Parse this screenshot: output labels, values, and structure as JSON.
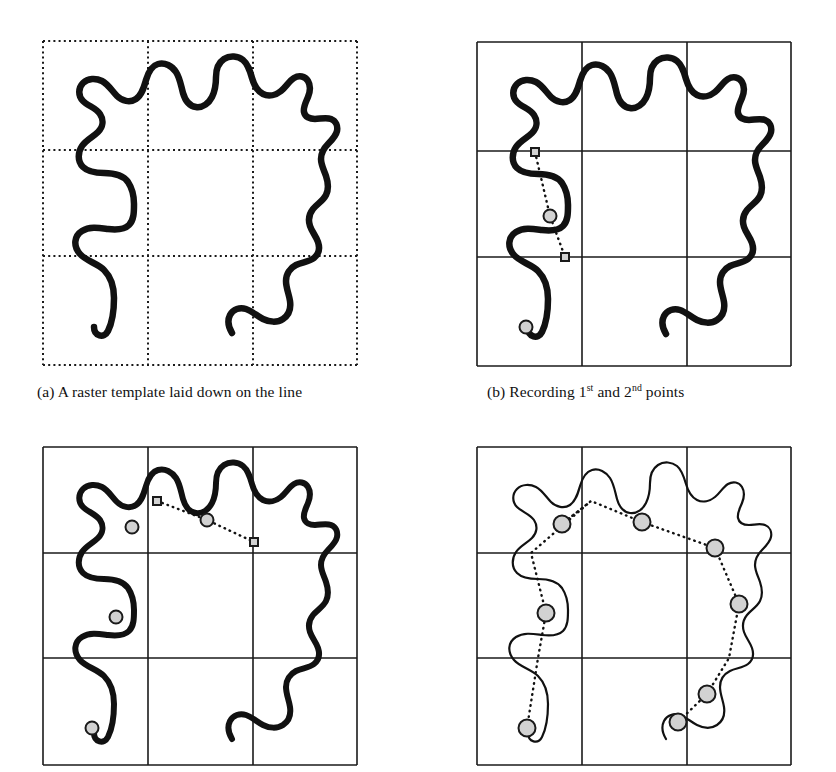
{
  "figure": {
    "kind": "raster-template-line-generalisation",
    "background": "#ffffff",
    "ink": "#111111",
    "grid_color": "#1a1a1a",
    "marker_fill": "#d2d2d2",
    "marker_stroke": "#1a1a1a",
    "dotted_connector_color": "#111111"
  },
  "captions": {
    "a_prefix": "(a)",
    "a_text": "A raster template laid down on the line",
    "b_prefix": "(b)",
    "b_text_before": "Recording 1",
    "b_sup1": "st",
    "b_text_middle": " and 2",
    "b_sup2": "nd",
    "b_text_after": " points",
    "c_text": "",
    "d_text": ""
  },
  "panels": [
    {
      "id": "a",
      "name": "panel-a-raster-template",
      "size": [
        316,
        326
      ],
      "grid": {
        "style": "dotted",
        "rows": 3,
        "cols": 3,
        "x_lines": [
          1,
          106,
          211,
          315
        ],
        "y_lines": [
          1,
          110,
          216,
          325
        ]
      },
      "line_width": 6.5,
      "line_style": "thick",
      "markers": [],
      "connectors": []
    },
    {
      "id": "b",
      "name": "panel-b-first-second-points",
      "size": [
        316,
        326
      ],
      "grid": {
        "style": "solid",
        "rows": 3,
        "cols": 3,
        "x_lines": [
          1,
          106,
          211,
          315
        ],
        "y_lines": [
          1,
          110,
          216,
          325
        ]
      },
      "line_width": 6.5,
      "line_style": "thick",
      "markers": [
        {
          "type": "circle",
          "name": "point-start",
          "x": 50,
          "y": 286,
          "r": 6.5
        },
        {
          "type": "circle",
          "name": "point-1st",
          "x": 74,
          "y": 175,
          "r": 6.5
        },
        {
          "type": "square",
          "name": "crossing-upper",
          "x": 59,
          "y": 111,
          "s": 8
        },
        {
          "type": "square",
          "name": "crossing-lower",
          "x": 89,
          "y": 216,
          "s": 8
        }
      ],
      "connectors": [
        {
          "name": "connector-b",
          "points": [
            [
              59,
              111
            ],
            [
              74,
              175
            ],
            [
              89,
              216
            ]
          ]
        }
      ]
    },
    {
      "id": "c",
      "name": "panel-c-third-fourth-points",
      "size": [
        316,
        320
      ],
      "grid": {
        "style": "solid",
        "rows": 3,
        "cols": 3,
        "x_lines": [
          1,
          106,
          211,
          315
        ],
        "y_lines": [
          1,
          107,
          212,
          319
        ]
      },
      "line_width": 6.0,
      "line_style": "thick",
      "markers": [
        {
          "type": "circle",
          "name": "point-start",
          "x": 50,
          "y": 282,
          "r": 6.5
        },
        {
          "type": "circle",
          "name": "point-1st",
          "x": 74,
          "y": 171,
          "r": 6.5
        },
        {
          "type": "circle",
          "name": "point-2nd",
          "x": 90,
          "y": 81,
          "r": 6.5
        },
        {
          "type": "square",
          "name": "crossing-top",
          "x": 115,
          "y": 55,
          "s": 8
        },
        {
          "type": "circle",
          "name": "point-3rd",
          "x": 165,
          "y": 74,
          "r": 6.5
        },
        {
          "type": "square",
          "name": "crossing-right",
          "x": 212,
          "y": 96,
          "s": 8
        }
      ],
      "connectors": [
        {
          "name": "connector-c",
          "points": [
            [
              115,
              55
            ],
            [
              165,
              74
            ],
            [
              212,
              96
            ]
          ]
        }
      ]
    },
    {
      "id": "d",
      "name": "panel-d-completed-generalisation",
      "size": [
        316,
        320
      ],
      "grid": {
        "style": "solid",
        "rows": 3,
        "cols": 3,
        "x_lines": [
          1,
          106,
          211,
          315
        ],
        "y_lines": [
          1,
          107,
          212,
          319
        ]
      },
      "line_width": 2.2,
      "line_style": "thin",
      "markers": [
        {
          "type": "circle",
          "name": "point-1",
          "x": 51,
          "y": 282,
          "r": 8.5
        },
        {
          "type": "circle",
          "name": "point-2",
          "x": 70,
          "y": 167,
          "r": 8.5
        },
        {
          "type": "circle",
          "name": "point-3",
          "x": 86,
          "y": 78,
          "r": 8.5
        },
        {
          "type": "circle",
          "name": "point-4",
          "x": 166,
          "y": 76,
          "r": 8.5
        },
        {
          "type": "circle",
          "name": "point-5",
          "x": 239,
          "y": 102,
          "r": 8.5
        },
        {
          "type": "circle",
          "name": "point-6",
          "x": 263,
          "y": 158,
          "r": 8.5
        },
        {
          "type": "circle",
          "name": "point-7",
          "x": 231,
          "y": 248,
          "r": 8.5
        },
        {
          "type": "circle",
          "name": "point-8",
          "x": 202,
          "y": 276,
          "r": 8.5
        }
      ],
      "connectors": [
        {
          "name": "connector-d",
          "points": [
            [
              51,
              282
            ],
            [
              62,
              212
            ],
            [
              70,
              167
            ],
            [
              55,
              107
            ],
            [
              115,
              55
            ],
            [
              86,
              78
            ],
            [
              115,
              55
            ],
            [
              166,
              76
            ],
            [
              239,
              102
            ],
            [
              263,
              158
            ],
            [
              253,
              212
            ],
            [
              231,
              248
            ],
            [
              202,
              276
            ]
          ]
        }
      ]
    }
  ],
  "curve": {
    "name": "meandering-line",
    "path": "M 52,287 C 52,296 62,299 66,291 C 70,283 72,270 72,258 C 72,246 68,236 62,230 C 55,223 44,221 38,214 C 31,206 32,196 40,191 C 48,186 58,188 66,189 C 74,190 82,190 87,185 C 92,180 92,172 92,164 C 92,156 90,148 86,142 C 81,135 70,133 62,133 C 54,133 46,132 41,127 C 35,121 36,112 40,106 C 44,100 51,97 56,92 C 61,87 62,80 58,74 C 54,68 46,66 41,61 C 36,56 36,48 41,43 C 46,38 54,38 60,41 C 66,44 70,51 75,56 C 80,61 88,63 94,59 C 100,55 102,47 104,40 C 106,33 109,26 116,24 C 123,22 130,26 134,32 C 138,38 139,46 141,53 C 143,60 147,66 154,67 C 161,68 167,63 170,57 C 173,51 174,44 174,37 C 174,30 176,23 182,19 C 188,15 196,16 201,20 C 206,24 208,31 210,38 C 212,45 215,51 221,54 C 227,57 234,55 239,51 C 244,47 247,41 252,38 C 257,35 263,36 266,41 C 269,46 268,52 266,57 C 264,62 261,67 262,72 C 263,77 268,79 273,79 C 278,79 284,77 289,79 C 294,81 296,86 295,91 C 294,96 290,100 286,104 C 282,108 279,113 279,119 C 279,125 282,130 284,136 C 286,142 287,149 284,155 C 281,161 275,164 271,169 C 267,174 266,180 268,186 C 270,192 274,196 276,202 C 278,208 277,214 272,218 C 267,222 260,222 254,225 C 248,228 244,234 244,241 C 244,248 247,254 248,261 C 249,268 247,275 241,279 C 235,283 227,282 221,279 C 215,276 210,271 204,269 C 198,267 191,269 188,275 C 185,281 187,288 190,293"
  }
}
